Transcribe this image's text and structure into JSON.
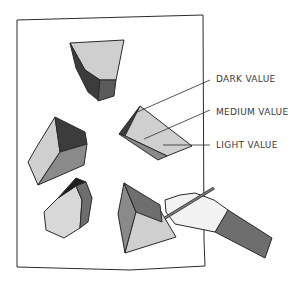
{
  "figure": {
    "labels": [
      {
        "id": "dark",
        "text": "DARK VALUE"
      },
      {
        "id": "medium",
        "text": "MEDIUM VALUE"
      },
      {
        "id": "light",
        "text": "LIGHT VALUE"
      }
    ],
    "colors": {
      "outline": "#2a2a2a",
      "dark_value": "#3c3c3c",
      "medium_value": "#8a8a8a",
      "light_value": "#cfcfcf",
      "sleeve": "#6e6e6e",
      "skin": "#f2f2f2"
    }
  }
}
